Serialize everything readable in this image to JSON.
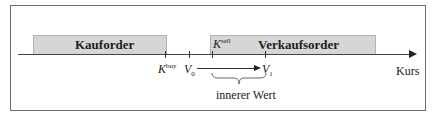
{
  "diagram": {
    "buy_box": {
      "label": "Kauforder"
    },
    "sell_box": {
      "label": "Verkaufsorder"
    },
    "axis": {
      "label": "Kurs"
    },
    "markers": {
      "k_buy": {
        "main": "K",
        "sup": "buy"
      },
      "v0": {
        "main": "V",
        "sub": "0"
      },
      "k_sell": {
        "main": "K",
        "sup": "sell"
      },
      "v1": {
        "main": "V",
        "sub": "1"
      }
    },
    "brace_label": "innerer Wert"
  }
}
